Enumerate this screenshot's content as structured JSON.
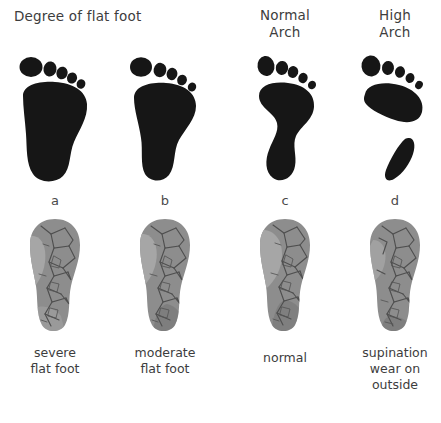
{
  "figure": {
    "title_left": "Degree of flat foot",
    "title_normal": "Normal\nArch",
    "title_high": "High\nArch"
  },
  "headers": {
    "flat_foot": "Degree of flat foot",
    "normal_arch_line1": "Normal",
    "normal_arch_line2": "Arch",
    "high_arch_line1": "High",
    "high_arch_line2": "Arch"
  },
  "columns": [
    {
      "letter": "a",
      "caption_line1": "severe",
      "caption_line2": "flat foot",
      "caption_line3": "",
      "footprint_type": "severe-flat-foot",
      "arch_contact": "full",
      "ink_color": "#161616",
      "sole_color": "#8d8d8d"
    },
    {
      "letter": "b",
      "caption_line1": "moderate",
      "caption_line2": "flat foot",
      "caption_line3": "",
      "footprint_type": "moderate-flat-foot",
      "arch_contact": "wide",
      "ink_color": "#161616",
      "sole_color": "#8d8d8d"
    },
    {
      "letter": "c",
      "caption_line1": "normal",
      "caption_line2": "",
      "caption_line3": "",
      "footprint_type": "normal-arch",
      "arch_contact": "narrow-waist",
      "ink_color": "#161616",
      "sole_color": "#8d8d8d"
    },
    {
      "letter": "d",
      "caption_line1": "supination",
      "caption_line2": "wear on",
      "caption_line3": "outside",
      "footprint_type": "high-arch",
      "arch_contact": "none-split",
      "ink_color": "#161616",
      "sole_color": "#8d8d8d"
    }
  ],
  "palette": {
    "background": "#ffffff",
    "ink": "#161616",
    "text": "#3d3d3d",
    "sole_mid": "#8d8d8d",
    "sole_light": "#a6a6a6",
    "sole_dark": "#6f6f6f",
    "tread_line": "#4f4f4f"
  }
}
